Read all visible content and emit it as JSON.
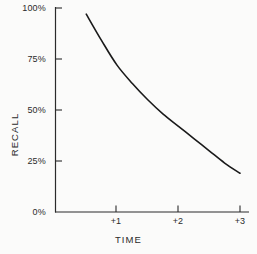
{
  "chart_data": {
    "type": "line",
    "title": "",
    "xlabel": "TIME",
    "ylabel": "RECALL",
    "xlim": [
      0,
      3.25
    ],
    "ylim": [
      0,
      100
    ],
    "grid": false,
    "legend": null,
    "y_ticks": [
      {
        "value": 100,
        "label": "100%"
      },
      {
        "value": 75,
        "label": "75%"
      },
      {
        "value": 50,
        "label": "50%"
      },
      {
        "value": 25,
        "label": "25%"
      },
      {
        "value": 0,
        "label": "0%"
      }
    ],
    "x_ticks": [
      {
        "value": 1,
        "label": "+1"
      },
      {
        "value": 2,
        "label": "+2"
      },
      {
        "value": 3,
        "label": "+3"
      }
    ],
    "series": [
      {
        "name": "recall",
        "color": "#1a1a1a",
        "x": [
          0.5,
          0.75,
          1.0,
          1.25,
          1.5,
          1.75,
          2.0,
          2.25,
          2.5,
          2.75,
          3.0
        ],
        "values": [
          97,
          84,
          72,
          63,
          55,
          48,
          42,
          36,
          30,
          24,
          19
        ]
      }
    ]
  },
  "axis": {
    "line_color": "#2b2b2b"
  }
}
